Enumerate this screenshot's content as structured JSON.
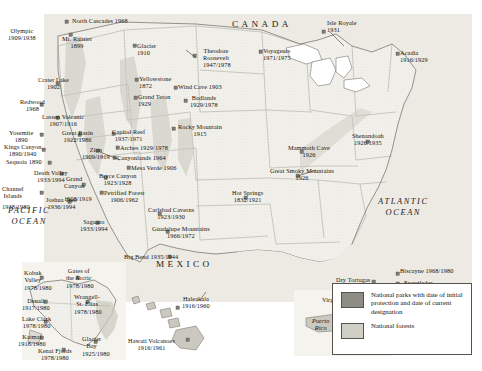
{
  "countries": [
    {
      "name": "CANADA",
      "x": 232,
      "y": 20
    },
    {
      "name": "MEXICO",
      "x": 156,
      "y": 260
    }
  ],
  "oceans": [
    {
      "name": "PACIFIC\nOCEAN",
      "x": 8,
      "y": 205
    },
    {
      "name": "ATLANTIC\nOCEAN",
      "x": 378,
      "y": 196
    }
  ],
  "territories": [
    {
      "name": "Puerto\nRico",
      "x": 312,
      "y": 318
    },
    {
      "name": "Virgin Is.",
      "x": 350,
      "y": 338
    }
  ],
  "parks": [
    {
      "name": "Olympic",
      "dates": "1909/1938",
      "x": 8,
      "y": 28,
      "align": "center"
    },
    {
      "name": "North Cascades 1968",
      "dates": "",
      "x": 72,
      "y": 18,
      "align": "left"
    },
    {
      "name": "Mt. Rainier",
      "dates": "1899",
      "x": 62,
      "y": 36,
      "align": "center"
    },
    {
      "name": "Glacier",
      "dates": "1910",
      "x": 137,
      "y": 43,
      "align": "left"
    },
    {
      "name": "Theodore",
      "dates": "Roosevelt",
      "x": 203,
      "y": 48,
      "align": "center"
    },
    {
      "name": "1947/1978",
      "dates": "",
      "x": 203,
      "y": 62,
      "align": "center"
    },
    {
      "name": "Voyageurs",
      "dates": "1971/1975",
      "x": 263,
      "y": 48,
      "align": "left"
    },
    {
      "name": "Isle Royale",
      "dates": "1931",
      "x": 327,
      "y": 20,
      "align": "left"
    },
    {
      "name": "Acadia",
      "dates": "1916/1929",
      "x": 400,
      "y": 50,
      "align": "left"
    },
    {
      "name": "Crater Lake",
      "dates": "1902",
      "x": 38,
      "y": 77,
      "align": "center"
    },
    {
      "name": "Yellowstone",
      "dates": "1872",
      "x": 139,
      "y": 76,
      "align": "left"
    },
    {
      "name": "Grand Teton",
      "dates": "1929",
      "x": 138,
      "y": 94,
      "align": "left"
    },
    {
      "name": "Wind Cave 1903",
      "dates": "",
      "x": 178,
      "y": 84,
      "align": "left"
    },
    {
      "name": "Badlands",
      "dates": "1929/1978",
      "x": 190,
      "y": 95,
      "align": "center"
    },
    {
      "name": "Redwood",
      "dates": "1968",
      "x": 20,
      "y": 99,
      "align": "center"
    },
    {
      "name": "Lassen Volcanic",
      "dates": "1907/1916",
      "x": 42,
      "y": 114,
      "align": "center"
    },
    {
      "name": "Yosemite",
      "dates": "1890",
      "x": 9,
      "y": 130,
      "align": "center"
    },
    {
      "name": "Great Basin",
      "dates": "1922/1986",
      "x": 62,
      "y": 130,
      "align": "center"
    },
    {
      "name": "Capitol Reef",
      "dates": "1937/1971",
      "x": 112,
      "y": 129,
      "align": "center"
    },
    {
      "name": "Rocky Mountain",
      "dates": "1915",
      "x": 178,
      "y": 124,
      "align": "center"
    },
    {
      "name": "Kings Canyon",
      "dates": "1890/1940",
      "x": 4,
      "y": 144,
      "align": "center"
    },
    {
      "name": "Zion",
      "dates": "1909/1919",
      "x": 82,
      "y": 147,
      "align": "center"
    },
    {
      "name": "Arches 1929/1978",
      "dates": "",
      "x": 120,
      "y": 145,
      "align": "left"
    },
    {
      "name": "Canyonlands 1964",
      "dates": "",
      "x": 117,
      "y": 155,
      "align": "left"
    },
    {
      "name": "Mesa Verde 1906",
      "dates": "",
      "x": 131,
      "y": 165,
      "align": "left"
    },
    {
      "name": "Sequoia 1890",
      "dates": "",
      "x": 6,
      "y": 159,
      "align": "left"
    },
    {
      "name": "Death Valley",
      "dates": "1933/1994",
      "x": 34,
      "y": 170,
      "align": "center"
    },
    {
      "name": "Bryce Canyon",
      "dates": "1923/1928",
      "x": 99,
      "y": 173,
      "align": "center"
    },
    {
      "name": "Grand",
      "dates": "Canyon",
      "x": 64,
      "y": 176,
      "align": "center"
    },
    {
      "name": "1908/1919",
      "dates": "",
      "x": 64,
      "y": 196,
      "align": "center"
    },
    {
      "name": "Petrified Forest",
      "dates": "1906/1962",
      "x": 104,
      "y": 190,
      "align": "center"
    },
    {
      "name": "Channel",
      "dates": "Islands",
      "x": 2,
      "y": 186,
      "align": "center"
    },
    {
      "name": "1938/1980",
      "dates": "",
      "x": 2,
      "y": 204,
      "align": "center"
    },
    {
      "name": "Joshua Tree",
      "dates": "1936/1994",
      "x": 46,
      "y": 197,
      "align": "center"
    },
    {
      "name": "Saguaro",
      "dates": "1933/1994",
      "x": 80,
      "y": 219,
      "align": "center"
    },
    {
      "name": "Carlsbad Caverns",
      "dates": "1923/1930",
      "x": 148,
      "y": 207,
      "align": "center"
    },
    {
      "name": "Guadalupe Mountains",
      "dates": "1966/1972",
      "x": 152,
      "y": 226,
      "align": "center"
    },
    {
      "name": "Big Bend 1935/1944",
      "dates": "",
      "x": 124,
      "y": 254,
      "align": "left"
    },
    {
      "name": "Hot Springs",
      "dates": "1832/1921",
      "x": 232,
      "y": 190,
      "align": "center"
    },
    {
      "name": "Great Smoky Mountains",
      "dates": "1926",
      "x": 270,
      "y": 168,
      "align": "center"
    },
    {
      "name": "Mammoth Cave",
      "dates": "1926",
      "x": 288,
      "y": 145,
      "align": "center"
    },
    {
      "name": "Shenandoah",
      "dates": "1926/1935",
      "x": 352,
      "y": 133,
      "align": "center"
    },
    {
      "name": "Biscayne 1968/1980",
      "dates": "",
      "x": 400,
      "y": 268,
      "align": "left"
    },
    {
      "name": "Everglades",
      "dates": "1934",
      "x": 404,
      "y": 280,
      "align": "center"
    },
    {
      "name": "Dry Tortugas",
      "dates": "1935/1992",
      "x": 336,
      "y": 277,
      "align": "center"
    }
  ],
  "alaska_parks": [
    {
      "name": "Kobuk",
      "dates": "Valley",
      "x": 24,
      "y": 270,
      "align": "center"
    },
    {
      "name": "1978/1980",
      "dates": "",
      "x": 24,
      "y": 285,
      "align": "center"
    },
    {
      "name": "Gates of",
      "dates": "the Arctic",
      "x": 66,
      "y": 268,
      "align": "center"
    },
    {
      "name": "1978/1980",
      "dates": "",
      "x": 66,
      "y": 283,
      "align": "center"
    },
    {
      "name": "Denali",
      "dates": "1917/1980",
      "x": 22,
      "y": 298,
      "align": "center"
    },
    {
      "name": "Wrangell-",
      "dates": "St. Elias",
      "x": 74,
      "y": 294,
      "align": "center"
    },
    {
      "name": "1978/1980",
      "dates": "",
      "x": 74,
      "y": 309,
      "align": "center"
    },
    {
      "name": "Lake Clark",
      "dates": "1978/1980",
      "x": 22,
      "y": 316,
      "align": "center"
    },
    {
      "name": "Katmai",
      "dates": "1918/1980",
      "x": 18,
      "y": 334,
      "align": "center"
    },
    {
      "name": "Kenai Fjords",
      "dates": "1978/1980",
      "x": 38,
      "y": 348,
      "align": "center"
    },
    {
      "name": "Glacier",
      "dates": "Bay",
      "x": 82,
      "y": 336,
      "align": "center"
    },
    {
      "name": "1925/1980",
      "dates": "",
      "x": 82,
      "y": 351,
      "align": "center"
    }
  ],
  "island_parks": [
    {
      "name": "Haleakala",
      "dates": "1916/1960",
      "x": 182,
      "y": 296,
      "align": "center"
    },
    {
      "name": "Hawaii Volcanoes",
      "dates": "1916/1961",
      "x": 128,
      "y": 338,
      "align": "center"
    },
    {
      "name": "Virgin Islands",
      "dates": "1956",
      "x": 322,
      "y": 297,
      "align": "center"
    }
  ],
  "legend": {
    "parks_label": "National parks with date of initial protection and date of current designation",
    "forests_label": "National forests",
    "park_color": "#8d8d86",
    "forest_color": "#cfcfc6"
  }
}
